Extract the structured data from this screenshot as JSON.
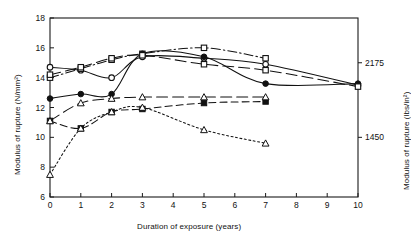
{
  "chart_data": {
    "type": "line",
    "title": "",
    "xlabel": "Duration of exposure (years)",
    "ylabel": "Modulus of rupture (N/mm²)",
    "ylabel_right": "Modulus of rupture (lbs/in²)",
    "xlim": [
      0,
      10
    ],
    "ylim": [
      6,
      18
    ],
    "xticks": [
      0,
      1,
      2,
      3,
      4,
      5,
      6,
      7,
      8,
      9,
      10
    ],
    "xticklabels": [
      "0",
      "1",
      "2",
      "3",
      "4",
      "5",
      "6",
      "7",
      "8",
      "9",
      "10"
    ],
    "yticks": [
      6,
      8,
      10,
      12,
      14,
      16,
      18
    ],
    "yticklabels": [
      "6",
      "8",
      "10",
      "12",
      "14",
      "16",
      "18"
    ],
    "right_ticks": [
      {
        "value": 15.0,
        "label": "2175"
      },
      {
        "value": 10.0,
        "label": "1450"
      }
    ],
    "grid": false,
    "legend": "none",
    "series": [
      {
        "name": "series-open-circle-solid",
        "marker": "open-circle",
        "linestyle": "solid",
        "x": [
          0,
          1,
          2,
          3,
          5,
          7,
          10
        ],
        "y": [
          14.7,
          14.5,
          14.0,
          15.4,
          15.3,
          14.9,
          13.5
        ]
      },
      {
        "name": "series-open-square-dashdot",
        "marker": "open-square",
        "linestyle": "dashdot",
        "x": [
          0,
          1,
          2,
          3,
          5,
          7
        ],
        "y": [
          14.0,
          14.6,
          15.2,
          15.6,
          16.0,
          15.3
        ]
      },
      {
        "name": "series-filled-circle-solid",
        "marker": "filled-circle",
        "linestyle": "solid",
        "x": [
          0,
          1,
          2,
          3,
          5,
          7,
          10
        ],
        "y": [
          12.6,
          12.9,
          12.9,
          15.6,
          15.4,
          13.6,
          13.6
        ]
      },
      {
        "name": "series-open-square-longdash",
        "marker": "open-square",
        "linestyle": "longdash",
        "x": [
          0,
          1,
          2,
          3,
          5,
          7,
          10
        ],
        "y": [
          14.2,
          14.7,
          15.3,
          15.5,
          14.9,
          14.5,
          13.4
        ]
      },
      {
        "name": "series-filled-square-dashed",
        "marker": "filled-square",
        "linestyle": "dashed",
        "x": [
          0,
          1,
          2,
          3,
          5,
          7
        ],
        "y": [
          11.1,
          10.6,
          11.7,
          11.9,
          12.3,
          12.4
        ]
      },
      {
        "name": "series-open-triangle-dotted",
        "marker": "open-triangle",
        "linestyle": "dotted",
        "x": [
          0,
          1,
          2,
          3,
          5,
          7
        ],
        "y": [
          7.5,
          10.6,
          11.7,
          12.0,
          10.5,
          9.6
        ]
      },
      {
        "name": "series-open-triangle-longdash",
        "marker": "open-triangle",
        "linestyle": "longdash",
        "x": [
          0,
          1,
          2,
          3,
          5,
          7
        ],
        "y": [
          11.1,
          12.3,
          12.6,
          12.7,
          12.7,
          12.7
        ]
      }
    ]
  }
}
